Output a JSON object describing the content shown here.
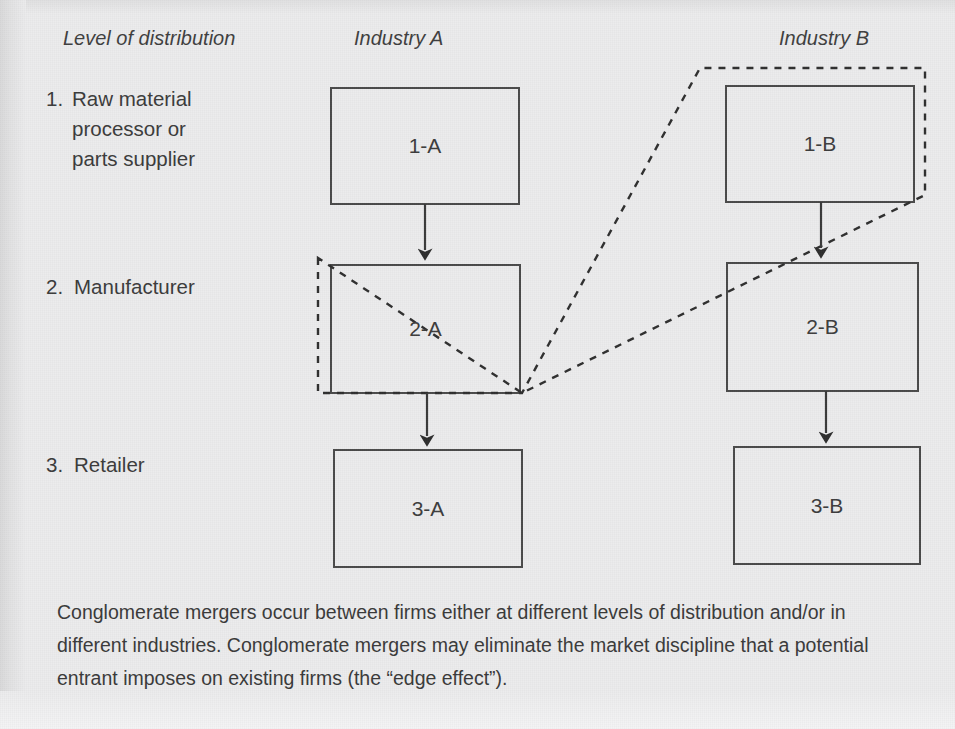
{
  "headers": {
    "level_col": "Level of distribution",
    "industry_a": "Industry A",
    "industry_b": "Industry B"
  },
  "levels": [
    {
      "number": "1.",
      "label": "Raw material\nprocessor or\nparts supplier"
    },
    {
      "number": "2.",
      "label": "Manufacturer"
    },
    {
      "number": "3.",
      "label": "Retailer"
    }
  ],
  "boxes": [
    {
      "id": "box-1-a",
      "label": "1-A",
      "x": 331,
      "y": 88,
      "w": 188,
      "h": 116
    },
    {
      "id": "box-1-b",
      "label": "1-B",
      "x": 726,
      "y": 86,
      "w": 188,
      "h": 116
    },
    {
      "id": "box-2-a",
      "label": "2-A",
      "x": 331,
      "y": 265,
      "w": 189,
      "h": 128
    },
    {
      "id": "box-2-b",
      "label": "2-B",
      "x": 727,
      "y": 263,
      "w": 191,
      "h": 128
    },
    {
      "id": "box-3-a",
      "label": "3-A",
      "x": 334,
      "y": 450,
      "w": 188,
      "h": 117
    },
    {
      "id": "box-3-b",
      "label": "3-B",
      "x": 734,
      "y": 447,
      "w": 186,
      "h": 117
    }
  ],
  "arrows": [
    {
      "name": "arrow-1a-to-2a",
      "from": "1-A",
      "to": "2-A"
    },
    {
      "name": "arrow-2a-to-3a",
      "from": "2-A",
      "to": "3-A"
    },
    {
      "name": "arrow-1b-to-2b",
      "from": "1-B",
      "to": "2-B"
    },
    {
      "name": "arrow-2b-to-3b",
      "from": "2-B",
      "to": "3-B"
    }
  ],
  "merger_outline": {
    "name": "conglomerate-merger-outline",
    "style": "dashed",
    "encloses": [
      "1-B",
      "2-A"
    ],
    "points": "318,258 318,393 522,393 700,68 925,68 925,195 522,393"
  },
  "caption": {
    "text": "Conglomerate mergers occur between firms either at different levels of distribution and/or in different industries. Conglomerate mergers may eliminate the market discipline that a potential entrant imposes on existing firms (the “edge effect”)."
  },
  "colors": {
    "background": "#ececed",
    "stroke": "#4a4a4a",
    "text": "#3b3b3b"
  }
}
